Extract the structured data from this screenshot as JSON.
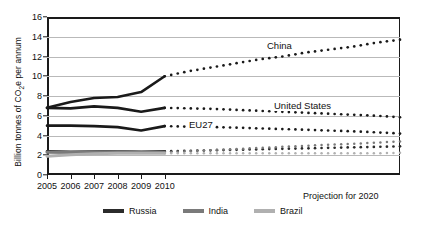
{
  "chart_data": {
    "type": "line",
    "title": "",
    "xlabel": "",
    "ylabel": "Billion tonnes of CO2e per annum",
    "ylabel_prefix": "Billion tonnes of CO",
    "ylabel_sub": "2",
    "ylabel_suffix": "e per annum",
    "ylim": [
      0,
      16
    ],
    "xlim": [
      2005,
      2020
    ],
    "grid": true,
    "legend_position": "bottom",
    "yticks": [
      0,
      2,
      4,
      6,
      8,
      10,
      12,
      14,
      16
    ],
    "xticks": [
      2005,
      2006,
      2007,
      2008,
      2009,
      2010
    ],
    "xtick_labels": [
      "2005",
      "2006",
      "2007",
      "2008",
      "2009",
      "2010"
    ],
    "projection_note": "Projection for 2020",
    "x_historical": [
      2005,
      2006,
      2007,
      2008,
      2009,
      2010
    ],
    "x_projection": [
      2010,
      2011,
      2012,
      2013,
      2014,
      2015,
      2016,
      2017,
      2018,
      2019,
      2020
    ],
    "series": [
      {
        "name": "China",
        "label_in_plot": "China",
        "color": "#1a1a1a",
        "historical": [
          6.8,
          7.4,
          7.8,
          7.9,
          8.4,
          10.0
        ],
        "projection": [
          10.0,
          10.5,
          10.9,
          11.3,
          11.7,
          12.0,
          12.4,
          12.7,
          13.0,
          13.4,
          13.7
        ]
      },
      {
        "name": "United States",
        "label_in_plot": "United States",
        "color": "#1a1a1a",
        "historical": [
          6.8,
          6.75,
          6.95,
          6.8,
          6.4,
          6.8
        ],
        "projection": [
          6.8,
          6.75,
          6.7,
          6.6,
          6.5,
          6.4,
          6.3,
          6.2,
          6.1,
          6.0,
          5.85
        ]
      },
      {
        "name": "EU27",
        "label_in_plot": "EU27",
        "color": "#1a1a1a",
        "historical": [
          5.0,
          5.0,
          4.95,
          4.85,
          4.5,
          4.95
        ],
        "projection": [
          4.95,
          4.9,
          4.85,
          4.8,
          4.72,
          4.65,
          4.58,
          4.5,
          4.42,
          4.32,
          4.2
        ]
      },
      {
        "name": "Russia",
        "label_in_plot": "",
        "color": "#2b2b2b",
        "historical": [
          2.4,
          2.35,
          2.38,
          2.4,
          2.35,
          2.4
        ],
        "projection": [
          2.4,
          2.45,
          2.5,
          2.55,
          2.6,
          2.65,
          2.7,
          2.75,
          2.8,
          2.85,
          2.9
        ]
      },
      {
        "name": "India",
        "label_in_plot": "",
        "color": "#7a7a7a",
        "historical": [
          2.3,
          2.28,
          2.3,
          2.35,
          2.3,
          2.3
        ],
        "projection": [
          2.3,
          2.4,
          2.52,
          2.63,
          2.74,
          2.85,
          2.96,
          3.07,
          3.15,
          3.28,
          3.4
        ]
      },
      {
        "name": "Brazil",
        "label_in_plot": "",
        "color": "#b0b0b0",
        "historical": [
          1.9,
          2.05,
          2.15,
          2.2,
          2.2,
          2.2
        ],
        "projection": [
          2.2,
          2.2,
          2.2,
          2.2,
          2.2,
          2.2,
          2.2,
          2.2,
          2.2,
          2.2,
          2.25
        ]
      }
    ],
    "legend": [
      {
        "label": "Russia",
        "color": "#2b2b2b"
      },
      {
        "label": "India",
        "color": "#7a7a7a"
      },
      {
        "label": "Brazil",
        "color": "#b0b0b0"
      }
    ]
  }
}
